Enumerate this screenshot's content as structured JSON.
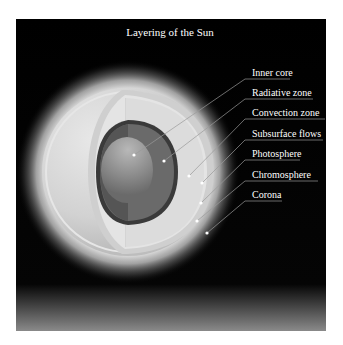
{
  "title": "Layering of the Sun",
  "colors": {
    "background": "#000000",
    "label_text": "#ffffff",
    "leader_line": "#9a9a9a"
  },
  "layers": [
    {
      "label": "Inner core",
      "dot": [
        134,
        155
      ],
      "label_y": 73,
      "underline_y": 79,
      "underline_end": 290
    },
    {
      "label": "Radiative zone",
      "dot": [
        164,
        161
      ],
      "label_y": 93,
      "underline_y": 99,
      "underline_end": 313
    },
    {
      "label": "Convection zone",
      "dot": [
        189,
        176
      ],
      "label_y": 113,
      "underline_y": 119,
      "underline_end": 325
    },
    {
      "label": "Subsurface flows",
      "dot": [
        202,
        183
      ],
      "label_y": 134,
      "underline_y": 140,
      "underline_end": 323
    },
    {
      "label": "Photosphere",
      "dot": [
        201,
        203
      ],
      "label_y": 154,
      "underline_y": 160,
      "underline_end": 300
    },
    {
      "label": "Chromosphere",
      "dot": [
        197,
        221
      ],
      "label_y": 175,
      "underline_y": 181,
      "underline_end": 318
    },
    {
      "label": "Corona",
      "dot": [
        207,
        233
      ],
      "label_y": 195,
      "underline_y": 201,
      "underline_end": 282
    }
  ]
}
